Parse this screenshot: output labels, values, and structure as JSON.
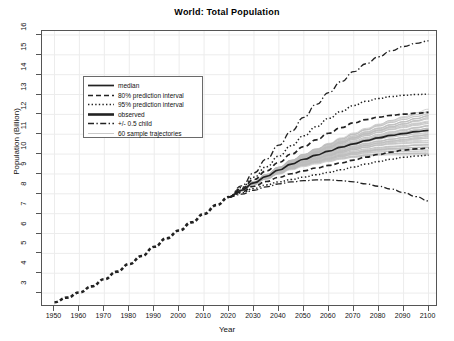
{
  "chart_data": {
    "type": "line",
    "title": "World: Total Population",
    "xlabel": "Year",
    "ylabel": "Population (Billion)",
    "xlim": [
      1945,
      2103
    ],
    "ylim": [
      2.4,
      16.2
    ],
    "xticks": [
      1950,
      1960,
      1970,
      1980,
      1990,
      2000,
      2010,
      2020,
      2030,
      2040,
      2050,
      2060,
      2070,
      2080,
      2090,
      2100
    ],
    "yticks": [
      3,
      4,
      5,
      6,
      7,
      8,
      9,
      10,
      11,
      12,
      13,
      14,
      15,
      16
    ],
    "grid": true,
    "legend_position": "upper left",
    "x_observed": [
      1950,
      1955,
      1960,
      1965,
      1970,
      1975,
      1980,
      1985,
      1990,
      1995,
      2000,
      2005,
      2010,
      2015,
      2020
    ],
    "x_projection": [
      2020,
      2025,
      2030,
      2035,
      2040,
      2045,
      2050,
      2055,
      2060,
      2065,
      2070,
      2075,
      2080,
      2085,
      2090,
      2095,
      2100
    ],
    "series": [
      {
        "name": "observed",
        "style": "thick-dashed",
        "values": [
          2.54,
          2.77,
          3.03,
          3.34,
          3.7,
          4.08,
          4.46,
          4.87,
          5.33,
          5.76,
          6.15,
          6.56,
          6.99,
          7.43,
          7.84
        ]
      },
      {
        "name": "median",
        "style": "solid",
        "values": [
          7.84,
          8.18,
          8.55,
          8.88,
          9.2,
          9.5,
          9.74,
          9.95,
          10.15,
          10.35,
          10.52,
          10.68,
          10.82,
          10.94,
          11.03,
          11.13,
          11.2
        ]
      },
      {
        "name": "80% prediction interval",
        "style": "dashed",
        "bound": "upper",
        "values": [
          7.84,
          8.26,
          8.72,
          9.15,
          9.58,
          10.0,
          10.38,
          10.72,
          11.05,
          11.33,
          11.57,
          11.74,
          11.86,
          11.95,
          12.01,
          12.06,
          12.1
        ]
      },
      {
        "name": "80% prediction interval",
        "style": "dashed",
        "bound": "lower",
        "values": [
          7.84,
          8.1,
          8.38,
          8.62,
          8.83,
          9.01,
          9.16,
          9.3,
          9.43,
          9.56,
          9.7,
          9.85,
          9.98,
          10.1,
          10.2,
          10.26,
          10.3
        ]
      },
      {
        "name": "95% prediction interval",
        "style": "dotted",
        "bound": "upper",
        "values": [
          7.84,
          8.32,
          8.84,
          9.36,
          9.9,
          10.42,
          10.92,
          11.38,
          11.8,
          12.15,
          12.45,
          12.66,
          12.8,
          12.9,
          12.96,
          13.0,
          13.02
        ]
      },
      {
        "name": "95% prediction interval",
        "style": "dotted",
        "bound": "lower",
        "values": [
          7.84,
          8.05,
          8.27,
          8.45,
          8.6,
          8.72,
          8.84,
          8.96,
          9.08,
          9.21,
          9.35,
          9.5,
          9.63,
          9.74,
          9.84,
          9.9,
          9.94
        ]
      },
      {
        "name": "+/- 0.5 child",
        "style": "dashdot",
        "bound": "upper",
        "values": [
          7.84,
          8.4,
          9.05,
          9.75,
          10.45,
          11.15,
          11.85,
          12.5,
          13.1,
          13.65,
          14.15,
          14.55,
          14.9,
          15.2,
          15.42,
          15.58,
          15.7
        ]
      },
      {
        "name": "+/- 0.5 child",
        "style": "dashdot",
        "bound": "lower",
        "values": [
          7.84,
          7.98,
          8.18,
          8.35,
          8.5,
          8.6,
          8.66,
          8.7,
          8.7,
          8.66,
          8.6,
          8.5,
          8.38,
          8.24,
          8.06,
          7.86,
          7.64
        ]
      }
    ],
    "sample_trajectories": {
      "name": "60 sample trajectories",
      "count": 60,
      "style": "thin-gray",
      "spread_at_2100": [
        9.9,
        12.2
      ]
    },
    "legend": [
      {
        "label": "median",
        "style": "solid"
      },
      {
        "label": "80% prediction interval",
        "style": "dashed"
      },
      {
        "label": "95% prediction interval",
        "style": "dotted"
      },
      {
        "label": "observed",
        "style": "thick-solid"
      },
      {
        "label": "+/- 0.5 child",
        "style": "dashdot"
      },
      {
        "label": "60 sample trajectories",
        "style": "thin-gray"
      }
    ],
    "colors": {
      "line": "#222222",
      "grid": "#ececec",
      "frame": "#555555",
      "trajectories": "#bdbdbd"
    }
  }
}
